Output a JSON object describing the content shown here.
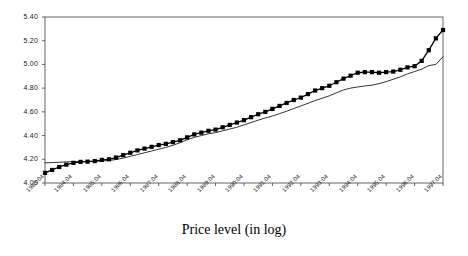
{
  "chart_data": {
    "type": "line",
    "title": "Price level (in log)",
    "xlabel": "",
    "ylabel": "",
    "ylim": [
      4.0,
      5.4
    ],
    "ytick_step": 0.2,
    "yticks": [
      "4.00",
      "4.20",
      "4.40",
      "4.60",
      "4.80",
      "5.00",
      "5.20",
      "5.40"
    ],
    "ytick_values": [
      4.0,
      4.2,
      4.4,
      4.6,
      4.8,
      5.0,
      5.2,
      5.4
    ],
    "grid": false,
    "legend": "none",
    "frame": "box",
    "xtick_labels": [
      "1983:04",
      "1984:04",
      "1985:04",
      "1986:04",
      "1987:04",
      "1988:04",
      "1989:04",
      "1990:04",
      "1991:04",
      "1992:04",
      "1993:04",
      "1994:04",
      "1995:04",
      "1996:04",
      "1997:04"
    ],
    "x_period_labels": [
      "1983:04",
      "1984:01",
      "1984:02",
      "1984:03",
      "1984:04",
      "1985:01",
      "1985:02",
      "1985:03",
      "1985:04",
      "1986:01",
      "1986:02",
      "1986:03",
      "1986:04",
      "1987:01",
      "1987:02",
      "1987:03",
      "1987:04",
      "1988:01",
      "1988:02",
      "1988:03",
      "1988:04",
      "1989:01",
      "1989:02",
      "1989:03",
      "1989:04",
      "1990:01",
      "1990:02",
      "1990:03",
      "1990:04",
      "1991:01",
      "1991:02",
      "1991:03",
      "1991:04",
      "1992:01",
      "1992:02",
      "1992:03",
      "1992:04",
      "1993:01",
      "1993:02",
      "1993:03",
      "1993:04",
      "1994:01",
      "1994:02",
      "1994:03",
      "1994:04",
      "1995:01",
      "1995:02",
      "1995:03",
      "1995:04",
      "1996:01",
      "1996:02",
      "1996:03",
      "1996:04",
      "1997:01",
      "1997:02",
      "1997:03",
      "1997:04"
    ],
    "series": [
      {
        "name": "series-with-markers",
        "style": "line-with-square-markers",
        "color": "#000000",
        "marker": "square",
        "values": [
          4.085,
          4.11,
          4.135,
          4.155,
          4.17,
          4.178,
          4.18,
          4.185,
          4.195,
          4.2,
          4.215,
          4.235,
          4.255,
          4.275,
          4.29,
          4.305,
          4.32,
          4.33,
          4.345,
          4.36,
          4.385,
          4.41,
          4.425,
          4.44,
          4.45,
          4.47,
          4.49,
          4.51,
          4.53,
          4.555,
          4.58,
          4.6,
          4.625,
          4.65,
          4.675,
          4.7,
          4.72,
          4.75,
          4.78,
          4.8,
          4.82,
          4.85,
          4.88,
          4.905,
          4.93,
          4.935,
          4.935,
          4.93,
          4.935,
          4.94,
          4.955,
          4.975,
          4.985,
          5.03,
          5.12,
          5.22,
          5.29
        ]
      },
      {
        "name": "series-plain-line",
        "style": "line",
        "color": "#000000",
        "marker": "none",
        "values": [
          4.17,
          4.172,
          4.175,
          4.178,
          4.18,
          4.182,
          4.182,
          4.183,
          4.185,
          4.19,
          4.198,
          4.21,
          4.225,
          4.24,
          4.255,
          4.27,
          4.285,
          4.3,
          4.318,
          4.34,
          4.365,
          4.385,
          4.4,
          4.415,
          4.425,
          4.44,
          4.455,
          4.47,
          4.49,
          4.51,
          4.53,
          4.548,
          4.565,
          4.585,
          4.605,
          4.628,
          4.65,
          4.672,
          4.695,
          4.715,
          4.735,
          4.76,
          4.785,
          4.8,
          4.81,
          4.818,
          4.825,
          4.838,
          4.855,
          4.875,
          4.895,
          4.92,
          4.94,
          4.96,
          4.99,
          5.0,
          5.065
        ]
      }
    ]
  }
}
